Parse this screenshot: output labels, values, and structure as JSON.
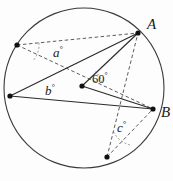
{
  "figure": {
    "name": "circle-angle-diagram",
    "width": 173,
    "height": 181,
    "background_color": "#fdfdfd",
    "stroke_color": "#3a3a3a",
    "dash_color": "#4a4a4a",
    "point_color": "#111111",
    "circle": {
      "center_x": 84,
      "center_y": 88,
      "radius": 80
    },
    "points": [
      {
        "id": "A",
        "label": "A",
        "x": 138,
        "y": 33,
        "label_x": 147,
        "label_y": 17
      },
      {
        "id": "B",
        "label": "B",
        "x": 153,
        "y": 109,
        "label_x": 161,
        "label_y": 105
      },
      {
        "id": "O",
        "label": "",
        "x": 82,
        "y": 86,
        "label_x": 0,
        "label_y": 0
      },
      {
        "id": "P",
        "label": "",
        "x": 17,
        "y": 45,
        "label_x": 0,
        "label_y": 0
      },
      {
        "id": "Q",
        "label": "",
        "x": 10,
        "y": 96,
        "label_x": 0,
        "label_y": 0
      },
      {
        "id": "R",
        "label": "",
        "x": 107,
        "y": 157,
        "label_x": 0,
        "label_y": 0
      }
    ],
    "solid_segments": [
      {
        "from": "Q",
        "to": "A"
      },
      {
        "from": "Q",
        "to": "B"
      },
      {
        "from": "O",
        "to": "A"
      },
      {
        "from": "O",
        "to": "B"
      }
    ],
    "dashed_segments": [
      {
        "from": "P",
        "to": "A"
      },
      {
        "from": "P",
        "to": "B"
      },
      {
        "from": "R",
        "to": "A"
      },
      {
        "from": "R",
        "to": "B"
      }
    ],
    "angle_labels": [
      {
        "id": "a",
        "text": "a",
        "degree_symbol": "°",
        "x": 53,
        "y": 45,
        "style": "italic"
      },
      {
        "id": "b",
        "text": "b",
        "degree_symbol": "°",
        "x": 45,
        "y": 83,
        "style": "italic"
      },
      {
        "id": "c",
        "text": "c",
        "degree_symbol": "°",
        "x": 117,
        "y": 120,
        "style": "italic"
      },
      {
        "id": "angle-60",
        "text": "60",
        "degree_symbol": "°",
        "x": 92,
        "y": 72,
        "style": "numeric"
      }
    ],
    "angle_arcs": [
      {
        "id": "arc-a",
        "cx": 17,
        "cy": 45,
        "r": 22
      },
      {
        "id": "arc-60",
        "cx": 82,
        "cy": 86,
        "r": 20
      },
      {
        "id": "arc-c",
        "cx": 107,
        "cy": 157,
        "r": 26
      }
    ]
  }
}
